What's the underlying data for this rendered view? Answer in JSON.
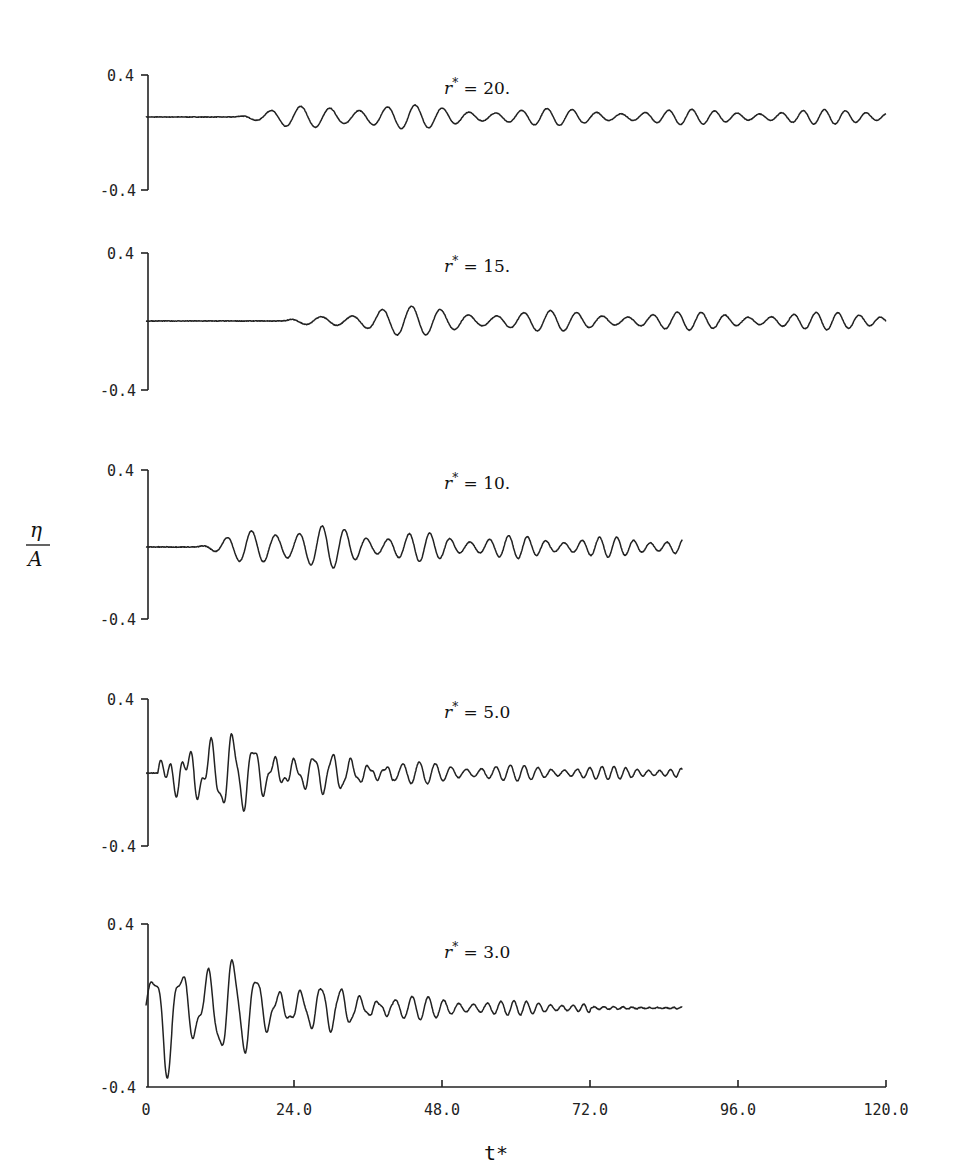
{
  "chart_data": {
    "type": "line",
    "title": "",
    "xlabel": "t*",
    "ylabel": "η / A",
    "xlim": [
      0,
      120
    ],
    "ylim": [
      -0.4,
      0.4
    ],
    "x_ticks": [
      "0",
      "24.0",
      "48.0",
      "72.0",
      "96.0",
      "120.0"
    ],
    "y_ticks": [
      "0.4",
      "-0.4"
    ],
    "grid": false,
    "legend": "none (each panel labelled by r*)",
    "series": [
      {
        "name": "r* = 20.",
        "label_var": "r*",
        "label_val": "= 20.",
        "t_end": 120,
        "onset_t": 14,
        "peak_amplitude": 0.12,
        "peak_t": 30,
        "late_amplitude": 0.05,
        "period_start": 5.6,
        "period_end": 3.3,
        "panel": {
          "y_top": 75,
          "y_bottom": 190,
          "y_zero": 117
        }
      },
      {
        "name": "r* = 15.",
        "label_var": "r*",
        "label_val": "= 15.",
        "t_end": 120,
        "onset_t": 22,
        "peak_amplitude": 0.1,
        "peak_t": 38,
        "late_amplitude": 0.05,
        "period_start": 6.0,
        "period_end": 3.4,
        "panel": {
          "y_top": 253,
          "y_bottom": 390,
          "y_zero": 321
        }
      },
      {
        "name": "r* = 10.",
        "label_var": "r*",
        "label_val": "= 10.",
        "t_end": 87,
        "onset_t": 8,
        "peak_amplitude": 0.15,
        "peak_t": 22,
        "late_amplitude": 0.05,
        "period_start": 4.6,
        "period_end": 2.6,
        "panel": {
          "y_top": 470,
          "y_bottom": 619,
          "y_zero": 547
        }
      },
      {
        "name": "r* = 5.0",
        "label_var": "r*",
        "label_val": "= 5.0",
        "t_end": 87,
        "onset_t": 2,
        "peak_amplitude": 0.26,
        "peak_t": 8,
        "late_amplitude": 0.03,
        "period_start": 4.2,
        "period_end": 1.7,
        "panel": {
          "y_top": 699,
          "y_bottom": 846,
          "y_zero": 773
        }
      },
      {
        "name": "r* = 3.0",
        "label_var": "r*",
        "label_val": "= 3.0",
        "t_end": 87,
        "onset_t": 0,
        "peak_amplitude": 0.4,
        "peak_t": 3,
        "late_amplitude": 0.02,
        "period_start": 5.0,
        "period_end": 1.2,
        "panel": {
          "y_top": 924,
          "y_bottom": 1087,
          "y_zero": 1008
        }
      }
    ]
  },
  "figure": {
    "ylabel_num": "η",
    "ylabel_den": "A",
    "xlabel": "t*",
    "y_tick_top": "0.4",
    "y_tick_bottom": "-0.4",
    "x_tick_labels": [
      "0",
      "24.0",
      "48.0",
      "72.0",
      "96.0",
      "120.0"
    ]
  }
}
